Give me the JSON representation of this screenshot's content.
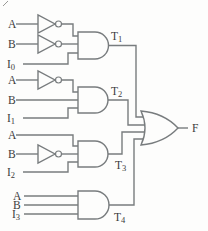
{
  "colors": {
    "wire": "#787c7e",
    "text": "#3b3b3b",
    "background": "#fdfdfc"
  },
  "inputs": {
    "group1": [
      {
        "label": "A",
        "sub": ""
      },
      {
        "label": "B",
        "sub": ""
      },
      {
        "label": "I",
        "sub": "0"
      }
    ],
    "group2": [
      {
        "label": "A",
        "sub": ""
      },
      {
        "label": "B",
        "sub": ""
      },
      {
        "label": "I",
        "sub": "1"
      }
    ],
    "group3": [
      {
        "label": "A",
        "sub": ""
      },
      {
        "label": "B",
        "sub": ""
      },
      {
        "label": "I",
        "sub": "2"
      }
    ],
    "group4": [
      {
        "label": "A",
        "sub": ""
      },
      {
        "label": "B",
        "sub": ""
      },
      {
        "label": "I",
        "sub": "3"
      }
    ]
  },
  "and_outputs": [
    {
      "label": "T",
      "sub": "1"
    },
    {
      "label": "T",
      "sub": "2"
    },
    {
      "label": "T",
      "sub": "3"
    },
    {
      "label": "T",
      "sub": "4"
    }
  ],
  "final_output": {
    "label": "F"
  }
}
